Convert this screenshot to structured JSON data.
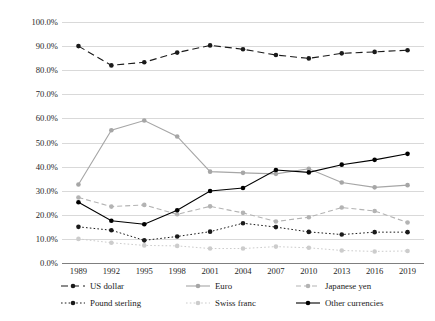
{
  "chart_data": {
    "type": "line",
    "title": "",
    "subtitle": "",
    "xlabel": "",
    "ylabel": "",
    "categories": [
      "1989",
      "1992",
      "1995",
      "1998",
      "2001",
      "2004",
      "2007",
      "2010",
      "2013",
      "2016",
      "2019"
    ],
    "ylim": [
      0,
      100
    ],
    "ytick_labels": [
      "0.0%",
      "10.0%",
      "20.0%",
      "30.0%",
      "40.0%",
      "50.0%",
      "60.0%",
      "70.0%",
      "80.0%",
      "90.0%",
      "100.0%"
    ],
    "ytick_values": [
      0,
      10,
      20,
      30,
      40,
      50,
      60,
      70,
      80,
      90,
      100
    ],
    "grid": true,
    "legend_position": "bottom",
    "series": [
      {
        "name": "US dollar",
        "color": "#1a1a1a",
        "dash": "long-dash",
        "values": [
          90.0,
          82.0,
          83.3,
          87.3,
          90.3,
          88.7,
          86.3,
          84.9,
          87.0,
          87.6,
          88.3
        ]
      },
      {
        "name": "Euro",
        "color": "#a6a6a6",
        "dash": "solid",
        "values": [
          32.6,
          55.1,
          59.1,
          52.5,
          37.9,
          37.4,
          37.0,
          39.1,
          33.4,
          31.4,
          32.3
        ]
      },
      {
        "name": "Japanese yen",
        "color": "#b3b3b3",
        "dash": "dash",
        "values": [
          27.2,
          23.4,
          24.1,
          20.2,
          23.5,
          20.8,
          17.2,
          19.0,
          23.0,
          21.6,
          16.8
        ]
      },
      {
        "name": "Pound sterling",
        "color": "#1a1a1a",
        "dash": "dot",
        "values": [
          15.0,
          13.6,
          9.4,
          11.0,
          13.0,
          16.5,
          14.9,
          12.9,
          11.8,
          12.8,
          12.8
        ]
      },
      {
        "name": "Swiss franc",
        "color": "#cccccc",
        "dash": "dot",
        "values": [
          10.0,
          8.4,
          7.3,
          7.1,
          6.0,
          6.0,
          6.8,
          6.3,
          5.2,
          4.8,
          5.0
        ]
      },
      {
        "name": "Other currencies",
        "color": "#000000",
        "dash": "solid",
        "values": [
          25.2,
          17.5,
          16.1,
          21.9,
          29.9,
          31.1,
          38.6,
          37.6,
          40.8,
          42.8,
          45.3
        ]
      }
    ]
  },
  "legend": {
    "items": [
      {
        "label": "US dollar"
      },
      {
        "label": "Euro"
      },
      {
        "label": "Japanese yen"
      },
      {
        "label": "Pound sterling"
      },
      {
        "label": "Swiss franc"
      },
      {
        "label": "Other currencies"
      }
    ]
  }
}
